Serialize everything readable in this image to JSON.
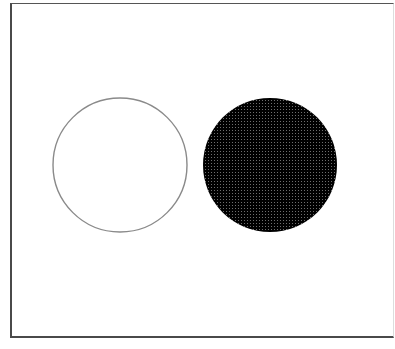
{
  "figure": {
    "background": "#ffffff",
    "frame": {
      "stroke": "#4a4a4a"
    },
    "shapes": [
      {
        "kind": "circle",
        "label": "open-circle",
        "fill": "none",
        "stroke": "#8a8a8a",
        "cx": 120,
        "cy": 165,
        "r": 67
      },
      {
        "kind": "circle",
        "label": "filled-circle",
        "fill": "#000000",
        "pattern": "halftone-dot-grid",
        "dot_color": "#6e6e6e",
        "cx": 270,
        "cy": 165,
        "r": 67
      }
    ]
  }
}
